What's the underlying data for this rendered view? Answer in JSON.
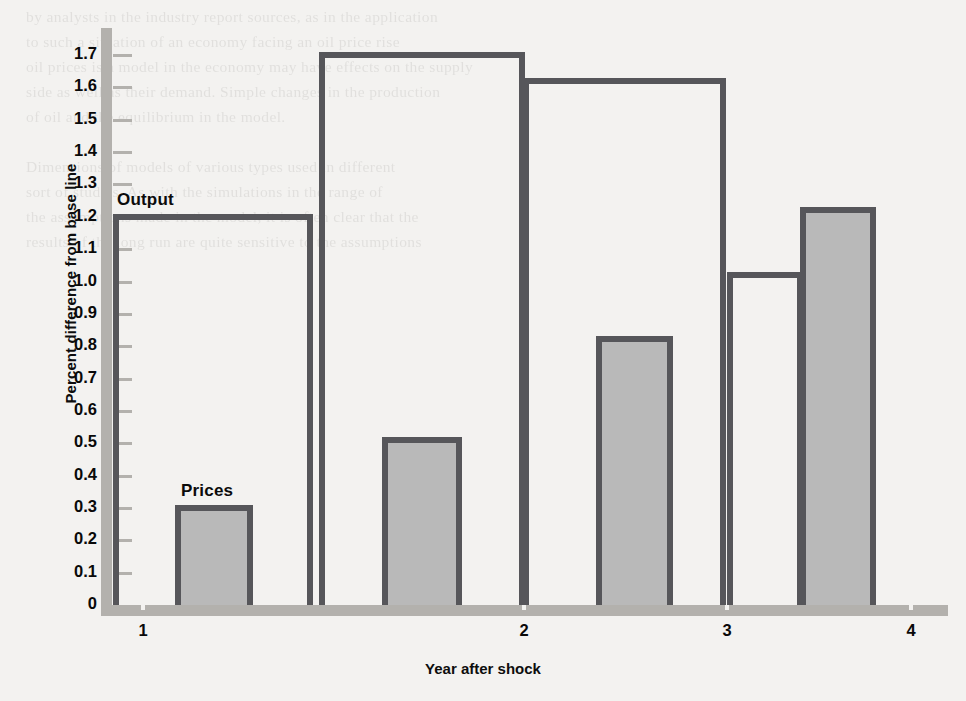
{
  "chart_data": {
    "type": "bar",
    "title": "",
    "xlabel": "Year after shock",
    "ylabel": "Percent difference from base line",
    "categories": [
      "1",
      "2",
      "3",
      "4"
    ],
    "ylim": [
      0,
      1.75
    ],
    "ytick_values": [
      0,
      0.1,
      0.2,
      0.3,
      0.4,
      0.5,
      0.6,
      0.7,
      0.8,
      0.9,
      1.0,
      1.1,
      1.2,
      1.3,
      1.4,
      1.5,
      1.6,
      1.7
    ],
    "ytick_labels": [
      "0",
      "0.1",
      "0.2",
      "0.3",
      "0.4",
      "0.5",
      "0.6",
      "0.7",
      "0.8",
      "0.9",
      "1.0",
      "1.1",
      "1.2",
      "1.3",
      "1.4",
      "1.5",
      "1.6",
      "1.7"
    ],
    "grid": false,
    "legend_position": "inline-annotation",
    "series": [
      {
        "name": "Output",
        "style": "white-outlined",
        "color": "#ffffff",
        "edge_color": "#56565a",
        "values": [
          1.21,
          1.71,
          1.63,
          1.03
        ]
      },
      {
        "name": "Prices",
        "style": "gray-filled",
        "color": "#b9b9b9",
        "edge_color": "#56565a",
        "values": [
          0.31,
          0.52,
          0.83,
          1.23
        ]
      }
    ],
    "annotations": [
      {
        "text": "Output",
        "series": "Output",
        "category": "1"
      },
      {
        "text": "Prices",
        "series": "Prices",
        "category": "1"
      }
    ]
  },
  "page": {
    "background_color": "#f3f2f0",
    "axis_color": "#b3b1ad",
    "bar_edge_color": "#56565a",
    "bar_fill_color": "#b9b9b9",
    "bleed_through_lines": [
      "by analysts in the industry report sources, as in the application",
      "to such a situation of an economy facing an oil price rise",
      "oil prices is a model in the economy may have effects on the supply",
      "side as well as their demand. Simple changes in the production",
      "of oil and the equilibrium in the model.",
      "",
      "Dimensions of models of various types used in different",
      "sort of studies. As with the simulations in the range of",
      "the assumptions made in the model, it is often clear that the",
      "results of the long run are quite sensitive to the assumptions"
    ]
  }
}
